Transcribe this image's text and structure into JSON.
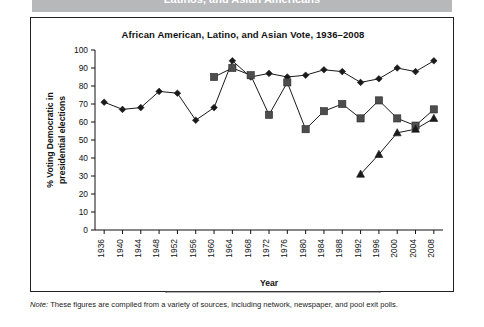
{
  "banner": {
    "text": "Latinos, and Asian Americans",
    "color": "#b6b8ba"
  },
  "figure": {
    "note_prefix": "Note:",
    "note_text": " These figures are compiled from a variety of sources, including network, newspaper, and pool exit polls."
  },
  "chart_data": {
    "type": "line",
    "title": "African American, Latino, and Asian Vote, 1936–2008",
    "xlabel": "Year",
    "ylabel": "% Voting Democratic in presidential elections",
    "ylabel_line1": "% Voting Democratic in",
    "ylabel_line2": "presidential elections",
    "ylim": [
      0,
      100
    ],
    "ytick_step": 10,
    "yticks": [
      0,
      10,
      20,
      30,
      40,
      50,
      60,
      70,
      80,
      90,
      100
    ],
    "categories": [
      1936,
      1940,
      1944,
      1948,
      1952,
      1956,
      1960,
      1964,
      1968,
      1972,
      1976,
      1980,
      1984,
      1988,
      1992,
      1996,
      2000,
      2004,
      2008
    ],
    "grid": false,
    "legend_position": "bottom",
    "series": [
      {
        "name": "Blacks",
        "marker": "diamond",
        "color": "#1a1a1a",
        "values": [
          71,
          67,
          68,
          77,
          76,
          61,
          68,
          94,
          85,
          87,
          85,
          86,
          89,
          88,
          82,
          84,
          90,
          88,
          94
        ]
      },
      {
        "name": "Latinos",
        "marker": "square",
        "color": "#4d4d4d",
        "values": [
          null,
          null,
          null,
          null,
          null,
          null,
          85,
          90,
          86,
          64,
          82,
          56,
          66,
          70,
          62,
          72,
          62,
          58,
          67
        ]
      },
      {
        "name": "Asians",
        "marker": "triangle",
        "color": "#1a1a1a",
        "values": [
          null,
          null,
          null,
          null,
          null,
          null,
          null,
          null,
          null,
          null,
          null,
          null,
          null,
          null,
          31,
          42,
          54,
          56,
          62
        ]
      }
    ]
  }
}
